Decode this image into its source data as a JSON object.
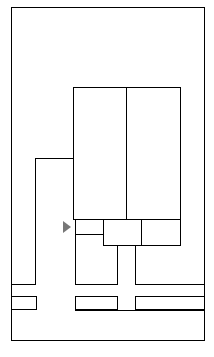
{
  "diagram": {
    "type": "floor-plan-wireframe",
    "colors": {
      "outline_light": "#c4c4c4",
      "outline_dark": "#555555",
      "marker": "#777777",
      "background": "#ffffff"
    },
    "outer_frame": {
      "x": 11,
      "y": 7,
      "w": 194,
      "h": 334
    },
    "central_block": {
      "x": 73,
      "y": 87,
      "w": 108,
      "h": 133,
      "divider_x": 126
    },
    "lower_row": {
      "y": 219,
      "h": 27,
      "cells": [
        {
          "x": 73,
          "w": 31,
          "style": "light"
        },
        {
          "x": 103,
          "w": 39,
          "style": "dark"
        },
        {
          "x": 141,
          "w": 40,
          "style": "dark"
        }
      ]
    },
    "marker": {
      "shape": "right-triangle",
      "x": 63,
      "y": 221,
      "w": 8,
      "h": 13
    },
    "bottom_boxes": [
      {
        "x": 11,
        "y": 296,
        "w": 26,
        "h": 14
      },
      {
        "x": 75,
        "y": 296,
        "w": 43,
        "h": 14
      },
      {
        "x": 135,
        "y": 296,
        "w": 70,
        "h": 14
      }
    ]
  }
}
